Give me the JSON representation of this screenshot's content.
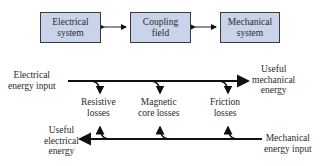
{
  "blocks": [
    {
      "id": "electrical",
      "line1": "Electrical",
      "line2": "system"
    },
    {
      "id": "coupling",
      "line1": "Coupling",
      "line2": "field"
    },
    {
      "id": "mechanical",
      "line1": "Mechanical",
      "line2": "system"
    }
  ],
  "flow": {
    "top_left": {
      "line1": "Electrical",
      "line2": "energy input"
    },
    "top_right": {
      "line1": "Useful",
      "line2": "mechanical",
      "line3": "energy"
    },
    "bottom_left": {
      "line1": "Useful",
      "line2": "electrical",
      "line3": "energy"
    },
    "bottom_right": {
      "line1": "Mechanical",
      "line2": "energy input"
    },
    "losses": [
      {
        "line1": "Resistive",
        "line2": "losses"
      },
      {
        "line1": "Magnetic",
        "line2": "core losses"
      },
      {
        "line1": "Friction",
        "line2": "losses"
      }
    ]
  },
  "colors": {
    "block_fill": "#c9d3ea",
    "line": "#111111"
  }
}
